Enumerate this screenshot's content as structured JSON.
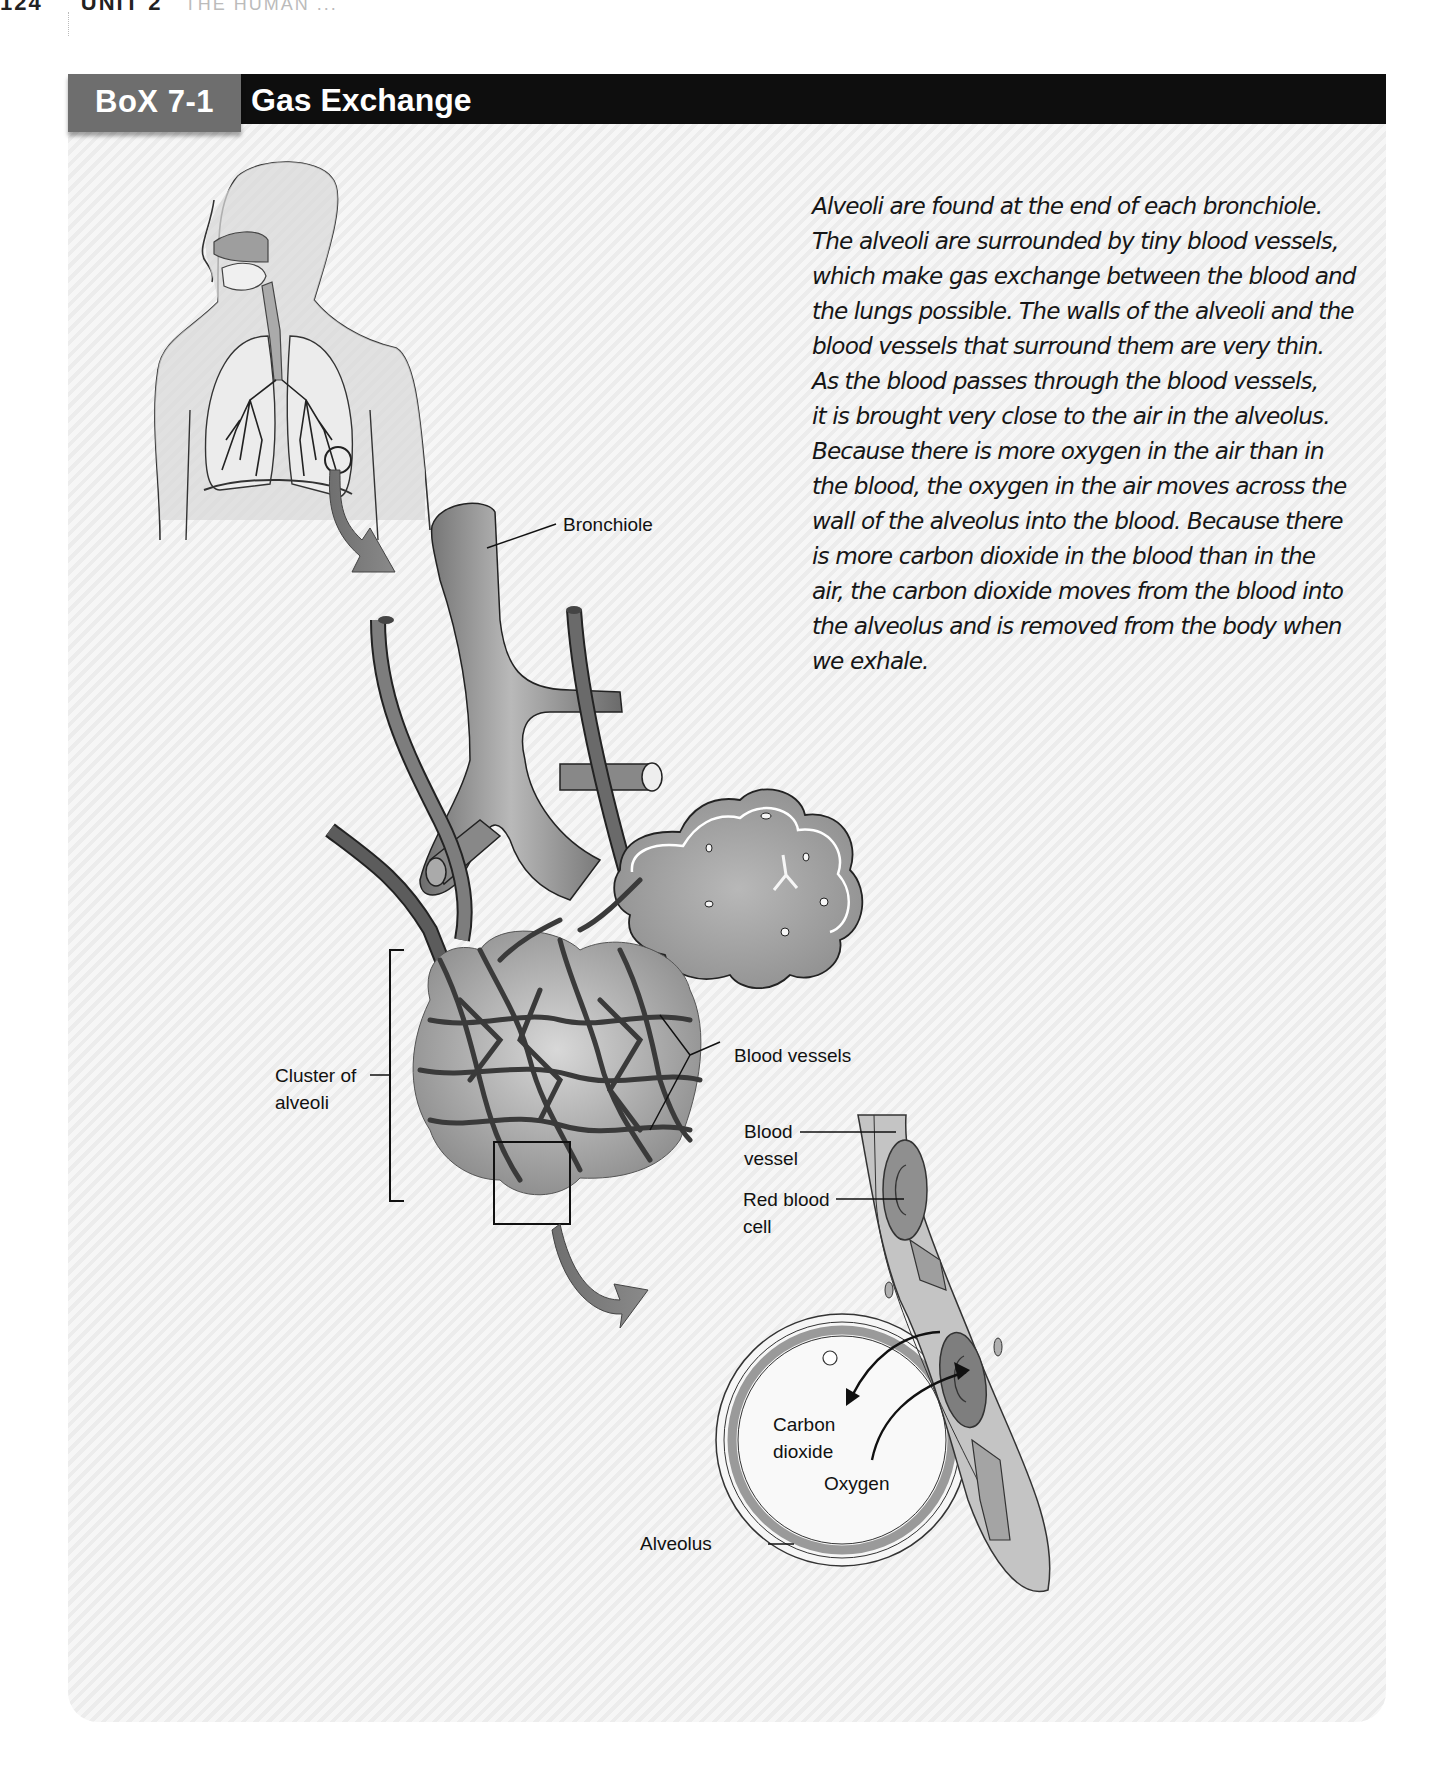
{
  "page_header": {
    "number": "124",
    "unit": "UNIT 2",
    "chapter": "THE HUMAN ..."
  },
  "box": {
    "label": "BoX 7-1",
    "title": "Gas Exchange",
    "colors": {
      "header_bar": "#0e0e0e",
      "label_bg": "#6e6e6e",
      "label_text": "#ffffff",
      "panel_bg": "#f0f0f0"
    }
  },
  "description": {
    "lines": [
      "Alveoli are found at the end of each bronchiole.",
      "The alveoli are surrounded by tiny blood vessels,",
      "which make gas exchange between the blood and",
      "the lungs possible. The walls of the alveoli and the",
      "blood vessels that surround them are very thin.",
      "As the blood passes through the blood vessels,",
      "it is brought very close to the air in the alveolus.",
      "Because there is more oxygen in the air than in",
      "the blood, the oxygen in the air moves across the",
      "wall of the alveolus into the blood. Because there",
      "is more carbon dioxide in the blood than in the",
      "air, the carbon dioxide moves from the blood into",
      "the alveolus and is removed from the body when",
      "we exhale."
    ]
  },
  "figure": {
    "labels": {
      "bronchiole": "Bronchiole",
      "blood_vessels": "Blood vessels",
      "cluster_line1": "Cluster of",
      "cluster_line2": "alveoli",
      "blood_vessel_line1": "Blood",
      "blood_vessel_line2": "vessel",
      "red_blood_cell_line1": "Red blood",
      "red_blood_cell_line2": "cell",
      "carbon_dioxide_line1": "Carbon",
      "carbon_dioxide_line2": "dioxide",
      "oxygen": "Oxygen",
      "alveolus": "Alveolus"
    },
    "icons": [
      "human-torso-respiratory-icon",
      "bronchiole-icon",
      "alveoli-cluster-icon",
      "alveolus-cross-section-icon",
      "zoom-arrow-icon",
      "gas-exchange-arrow-icon"
    ]
  }
}
